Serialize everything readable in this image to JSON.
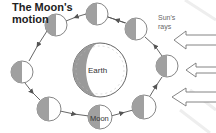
{
  "title_line1": "The Moon's",
  "title_line2": "motion",
  "sun_label_line1": "Sun's",
  "sun_label_line2": "rays",
  "earth_label": "Earth",
  "moon_label": "Moon",
  "colors": {
    "outline": "#6e6e6e",
    "shadow": "#9a9a9a",
    "lit": "#ffffff",
    "orbit": "#555555"
  },
  "moons": [
    {
      "cx": 56,
      "cy": 25
    },
    {
      "cx": 97,
      "cy": 14
    },
    {
      "cx": 136,
      "cy": 29
    },
    {
      "cx": 167,
      "cy": 66
    },
    {
      "cx": 144,
      "cy": 107
    },
    {
      "cx": 100,
      "cy": 117
    },
    {
      "cx": 49,
      "cy": 109
    },
    {
      "cx": 22,
      "cy": 72
    }
  ],
  "sun_rays_count": 3
}
